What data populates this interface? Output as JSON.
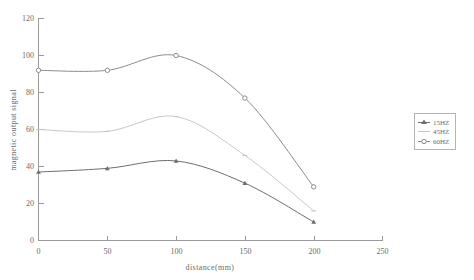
{
  "chart_data": {
    "type": "line",
    "title": "",
    "xlabel": "distance(mm)",
    "ylabel": "magnetic output signal",
    "xlim": [
      0,
      250
    ],
    "ylim": [
      0,
      120
    ],
    "xticks": [
      0,
      50,
      100,
      150,
      200,
      250
    ],
    "yticks": [
      0,
      20,
      40,
      60,
      80,
      100,
      120
    ],
    "grid": false,
    "legend_position": "right-outside",
    "x": [
      0,
      50,
      100,
      150,
      200
    ],
    "series": [
      {
        "name": "15HZ",
        "color": "#6e6e6e",
        "marker": "triangle",
        "values": [
          37,
          39,
          43,
          31,
          10
        ]
      },
      {
        "name": "45HZ",
        "color": "#c8c8c8",
        "marker": "line",
        "values": [
          60,
          59,
          67,
          46,
          16
        ]
      },
      {
        "name": "60HZ",
        "color": "#8c8c8c",
        "marker": "circle",
        "values": [
          92,
          92,
          100,
          77,
          29
        ]
      }
    ]
  },
  "axes": {
    "xlabel": "distance(mm)",
    "ylabel": "magnetic output signal",
    "xtick_labels": [
      "0",
      "50",
      "100",
      "150",
      "200",
      "250"
    ],
    "ytick_labels": [
      "0",
      "20",
      "40",
      "60",
      "80",
      "100",
      "120"
    ]
  },
  "legend": {
    "items": [
      {
        "label": "15HZ"
      },
      {
        "label": "45HZ"
      },
      {
        "label": "60HZ"
      }
    ]
  }
}
